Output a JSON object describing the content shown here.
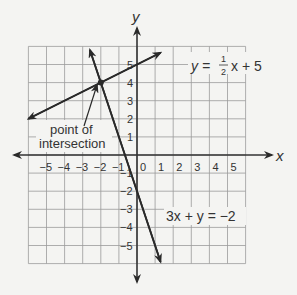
{
  "chart_data": {
    "type": "line",
    "title": "",
    "xlabel": "x",
    "ylabel": "y",
    "xlim": [
      -6,
      6
    ],
    "ylim": [
      -6,
      6
    ],
    "grid": true,
    "x_ticks": [
      "-5",
      "-4",
      "-3",
      "-2",
      "-1",
      "0",
      "1",
      "2",
      "3",
      "4",
      "5"
    ],
    "y_ticks": [
      "5",
      "4",
      "3",
      "2",
      "1",
      "-1",
      "-2",
      "-3",
      "-4",
      "-5"
    ],
    "series": [
      {
        "name": "y = 1/2 x + 5",
        "equation": "y = ½x + 5",
        "slope": 0.5,
        "intercept": 5,
        "x": [
          -6,
          0,
          1.3
        ],
        "y": [
          2,
          5,
          5.65
        ]
      },
      {
        "name": "3x + y = -2",
        "equation": "3x + y = −2",
        "slope": -3,
        "intercept": -2,
        "x": [
          -2.6,
          -2,
          0,
          1.3
        ],
        "y": [
          5.8,
          4,
          -2,
          -5.9
        ]
      }
    ],
    "annotations": [
      {
        "text": "point of intersection",
        "point": [
          -2,
          4
        ]
      }
    ],
    "intersection": {
      "x": -2,
      "y": 4
    }
  },
  "labels": {
    "x_axis": "x",
    "y_axis": "y",
    "line1_lhs": "y =",
    "line1_num": "1",
    "line1_den": "2",
    "line1_rhs": "x + 5",
    "line2": "3x + y = −2",
    "annotation_line1": "point of",
    "annotation_line2": "intersection",
    "origin": "0"
  },
  "colors": {
    "background": "#f4f4f2",
    "grid": "#9a9a9a",
    "axis": "#333333",
    "line": "#2a2a2a"
  }
}
